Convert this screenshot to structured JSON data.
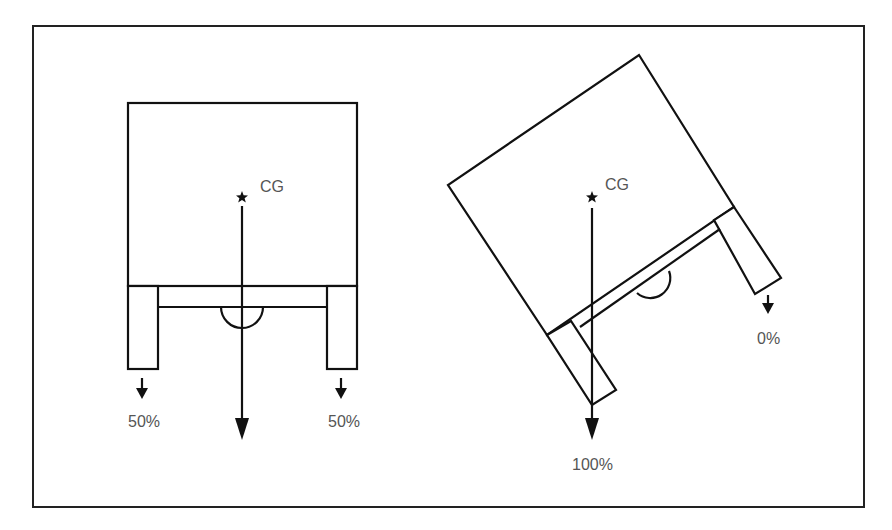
{
  "figure": {
    "colors": {
      "stroke": "#111111",
      "label": "#555555",
      "background": "#ffffff"
    },
    "left_diagram": {
      "title": "upright",
      "cg_label": "CG",
      "cg_marker": "star-icon",
      "left_load_label": "50%",
      "right_load_label": "50%"
    },
    "right_diagram": {
      "title": "tilted",
      "cg_label": "CG",
      "cg_marker": "star-icon",
      "left_load_label": "100%",
      "right_load_label": "0%"
    }
  }
}
